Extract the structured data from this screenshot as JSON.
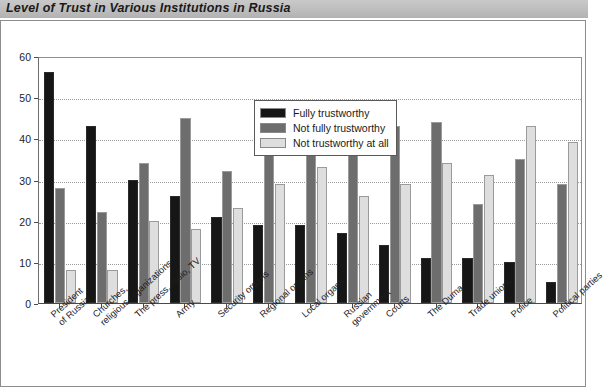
{
  "title": "Level of Trust in Various Institutions in Russia",
  "legend": {
    "position": "inside-top-center",
    "entries": [
      {
        "label": "Fully trustworthy",
        "color": "#161616"
      },
      {
        "label": "Not fully trustworthy",
        "color": "#6d6d6d"
      },
      {
        "label": "Not trustworthy at all",
        "color": "#dedede"
      }
    ]
  },
  "axis": {
    "y_title": "Percent",
    "y_ticks": [
      "0",
      "10",
      "20",
      "30",
      "40",
      "50",
      "60"
    ]
  },
  "chart_data": {
    "type": "bar",
    "title": "Level of Trust in Various Institutions in Russia",
    "xlabel": "",
    "ylabel": "Percent",
    "ylim": [
      0,
      60
    ],
    "ytick_step": 10,
    "grid": true,
    "legend_position": "upper center inside",
    "categories": [
      "President of Russia",
      "Churches, religious organizations",
      "The press, radio, TV",
      "Army",
      "Security organs",
      "Regional organs",
      "Local organs",
      "Russian government",
      "Courts",
      "The Duma",
      "Trade unions",
      "Police",
      "Political parties"
    ],
    "category_lines": [
      [
        "President",
        "of Russia"
      ],
      [
        "Churches,",
        "religious organizations"
      ],
      [
        "The press, radio, TV",
        ""
      ],
      [
        "Army",
        ""
      ],
      [
        "Security organs",
        ""
      ],
      [
        "Regional organs",
        ""
      ],
      [
        "Local organs",
        ""
      ],
      [
        "Russian",
        "government"
      ],
      [
        "Courts",
        ""
      ],
      [
        "The Duma",
        ""
      ],
      [
        "Trade unions",
        ""
      ],
      [
        "Police",
        ""
      ],
      [
        "Political parties",
        ""
      ]
    ],
    "series": [
      {
        "name": "Fully trustworthy",
        "color": "#161616",
        "values": [
          56,
          43,
          30,
          26,
          21,
          19,
          19,
          17,
          14,
          11,
          11,
          10,
          5
        ]
      },
      {
        "name": "Not fully trustworthy",
        "color": "#6d6d6d",
        "values": [
          28,
          22,
          34,
          45,
          32,
          37,
          37,
          41,
          43,
          44,
          24,
          35,
          29
        ]
      },
      {
        "name": "Not trustworthy at all",
        "color": "#dedede",
        "values": [
          8,
          8,
          20,
          18,
          23,
          29,
          33,
          26,
          29,
          34,
          31,
          43,
          39
        ]
      }
    ]
  }
}
